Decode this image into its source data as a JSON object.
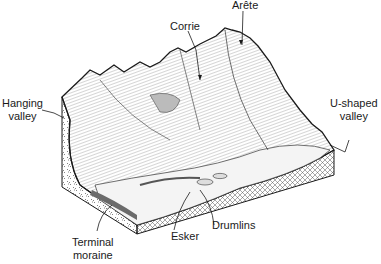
{
  "diagram": {
    "labels": {
      "arete": "Arête",
      "corrie": "Corrie",
      "hanging_valley_1": "Hanging",
      "hanging_valley_2": "valley",
      "u_shaped_valley_1": "U-shaped",
      "u_shaped_valley_2": "valley",
      "terminal_moraine_1": "Terminal",
      "terminal_moraine_2": "moraine",
      "esker": "Esker",
      "drumlins": "Drumlins"
    },
    "colors": {
      "ink": "#1a1a1a",
      "background": "#ffffff",
      "moraine_fill": "#6b6b6b"
    }
  }
}
